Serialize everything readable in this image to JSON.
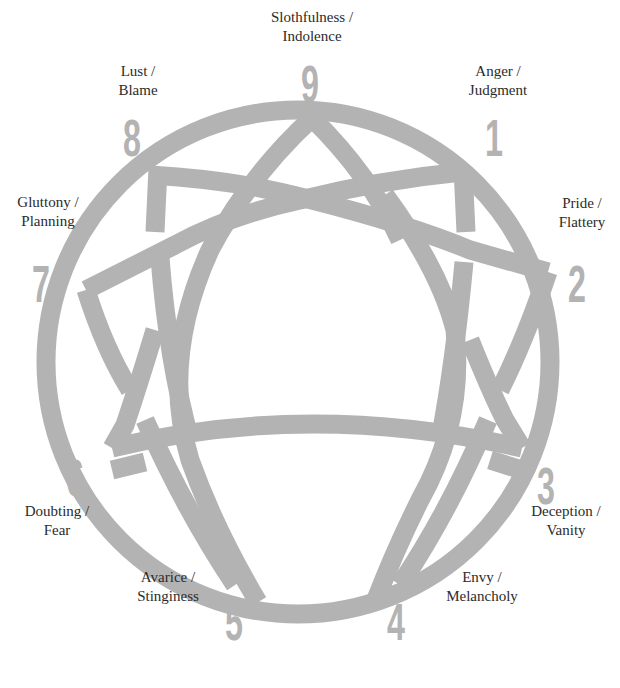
{
  "diagram": {
    "type": "enneagram",
    "line_color": "#b3b3b3",
    "number_color": "#b3b3b3",
    "text_color": "#2b2b2b",
    "points": [
      {
        "number": "9",
        "line1": "Slothfulness /",
        "line2": "Indolence"
      },
      {
        "number": "1",
        "line1": "Anger /",
        "line2": "Judgment"
      },
      {
        "number": "2",
        "line1": "Pride /",
        "line2": "Flattery"
      },
      {
        "number": "3",
        "line1": "Deception /",
        "line2": "Vanity"
      },
      {
        "number": "4",
        "line1": "Envy /",
        "line2": "Melancholy"
      },
      {
        "number": "5",
        "line1": "Avarice /",
        "line2": "Stinginess"
      },
      {
        "number": "6",
        "line1": "Doubting /",
        "line2": "Fear"
      },
      {
        "number": "7",
        "line1": "Gluttony /",
        "line2": "Planning"
      },
      {
        "number": "8",
        "line1": "Lust /",
        "line2": "Blame"
      }
    ]
  }
}
